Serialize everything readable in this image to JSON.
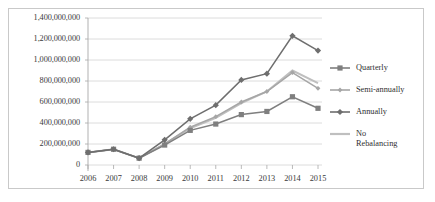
{
  "chart_data": {
    "type": "line",
    "title": "",
    "xlabel": "",
    "ylabel": "",
    "grid": true,
    "legend_position": "right",
    "categories": [
      "2006",
      "2007",
      "2008",
      "2009",
      "2010",
      "2011",
      "2012",
      "2013",
      "2014",
      "2015"
    ],
    "x": [
      2006,
      2007,
      2008,
      2009,
      2010,
      2011,
      2012,
      2013,
      2014,
      2015
    ],
    "ylim": [
      0,
      1400000000
    ],
    "ytick_labels": [
      "1,400,000,000",
      "1,200,000,000",
      "1,000,000,000",
      "800,000,000",
      "600,000,000",
      "400,000,000",
      "200,000,000",
      "0"
    ],
    "ytick_values": [
      1400000000,
      1200000000,
      1000000000,
      800000000,
      600000000,
      400000000,
      200000000,
      0
    ],
    "series": [
      {
        "name": "Quarterly",
        "color": "#7f7f7f",
        "marker": "square",
        "values": [
          120000000,
          150000000,
          65000000,
          190000000,
          330000000,
          390000000,
          480000000,
          510000000,
          650000000,
          540000000
        ]
      },
      {
        "name": "Semi-annually",
        "color": "#a6a6a6",
        "marker": "cross",
        "values": [
          120000000,
          150000000,
          65000000,
          200000000,
          360000000,
          460000000,
          600000000,
          700000000,
          880000000,
          730000000
        ]
      },
      {
        "name": "Annually",
        "color": "#6e6e6e",
        "marker": "diamond",
        "values": [
          120000000,
          150000000,
          65000000,
          240000000,
          440000000,
          570000000,
          810000000,
          870000000,
          1230000000,
          1090000000
        ]
      },
      {
        "name": "No Rebalancing",
        "color": "#bfbfbf",
        "marker": "none",
        "values": [
          120000000,
          150000000,
          65000000,
          200000000,
          350000000,
          450000000,
          590000000,
          700000000,
          900000000,
          780000000
        ]
      }
    ]
  },
  "legend": {
    "entries": [
      {
        "label": "Quarterly",
        "label2": ""
      },
      {
        "label": "Semi-annually",
        "label2": ""
      },
      {
        "label": "Annually",
        "label2": ""
      },
      {
        "label": "No",
        "label2": "Rebalancing"
      }
    ]
  },
  "colors": {
    "grid": "#d3d3d3",
    "axis": "#a8a8a8",
    "border": "#c9c9c9",
    "text": "#3a3a3a"
  }
}
